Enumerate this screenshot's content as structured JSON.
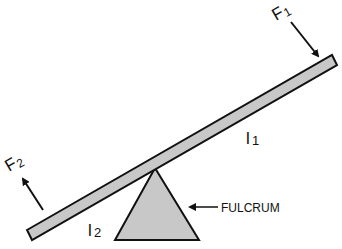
{
  "diagram": {
    "type": "lever",
    "labels": {
      "f1": {
        "main": "F",
        "sub": "1"
      },
      "f2": {
        "main": "F",
        "sub": "2"
      },
      "l1": {
        "main": "l",
        "sub": "1"
      },
      "l2": {
        "main": "l",
        "sub": "2"
      },
      "fulcrum": "FULCRUM"
    },
    "colors": {
      "fill": "#c8c8c8",
      "stroke": "#111111"
    }
  }
}
